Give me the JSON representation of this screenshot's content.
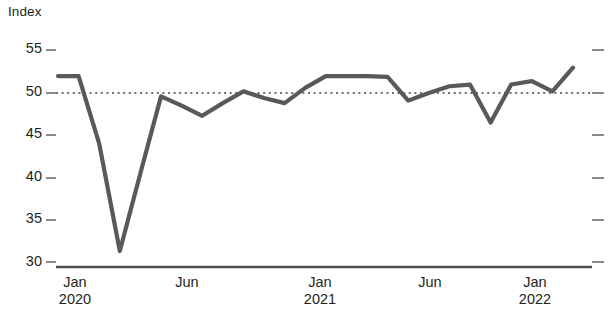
{
  "chart_data": {
    "type": "line",
    "title": "",
    "subtitle": "",
    "ylabel": "Index",
    "xlabel": "",
    "ylim": [
      29.2,
      56.5
    ],
    "yticks": [
      30,
      35,
      40,
      45,
      50,
      55
    ],
    "ytick_labels": [
      "30",
      "35",
      "40",
      "45",
      "50",
      "55"
    ],
    "grid": false,
    "legend": null,
    "reference_line": {
      "name": "no-change-level",
      "value": 50,
      "style": "dotted",
      "color": "#58595b"
    },
    "series": [
      {
        "name": "Index",
        "color": "#58595b",
        "x": [
          "Jan 2020",
          "Feb 2020",
          "Mar 2020",
          "Apr 2020",
          "May 2020",
          "Jun 2020",
          "Jul 2020",
          "Aug 2020",
          "Sep 2020",
          "Oct 2020",
          "Nov 2020",
          "Dec 2020",
          "Jan 2021",
          "Feb 2021",
          "Mar 2021",
          "Apr 2021",
          "May 2021",
          "Jun 2021",
          "Jul 2021",
          "Aug 2021",
          "Sep 2021",
          "Oct 2021",
          "Nov 2021",
          "Dec 2021",
          "Jan 2022",
          "Feb 2022"
        ],
        "values": [
          52.0,
          52.0,
          44.0,
          31.3,
          40.5,
          49.6,
          48.5,
          47.3,
          48.8,
          50.2,
          49.4,
          48.8,
          50.6,
          52.0,
          52.0,
          52.0,
          51.9,
          49.1,
          50.0,
          50.8,
          51.0,
          46.5,
          51.0,
          51.4,
          50.2,
          53.0
        ]
      }
    ],
    "xtick_positions": [
      "Jan 2020",
      "Jun 2020",
      "Jan 2021",
      "Jun 2021",
      "Jan 2022"
    ],
    "xticks": [
      {
        "month": "Jan",
        "year": "2020"
      },
      {
        "month": "Jun",
        "year": ""
      },
      {
        "month": "Jan",
        "year": "2021"
      },
      {
        "month": "Jun",
        "year": ""
      },
      {
        "month": "Jan",
        "year": "2022"
      }
    ]
  },
  "axis": {
    "y_title": "Index",
    "y_tick_0": "30",
    "y_tick_1": "35",
    "y_tick_2": "40",
    "y_tick_3": "45",
    "y_tick_4": "50",
    "y_tick_5": "55",
    "x_tick_0_month": "Jan",
    "x_tick_0_year": "2020",
    "x_tick_1_month": "Jun",
    "x_tick_1_year": "",
    "x_tick_2_month": "Jan",
    "x_tick_2_year": "2021",
    "x_tick_3_month": "Jun",
    "x_tick_3_year": "",
    "x_tick_4_month": "Jan",
    "x_tick_4_year": "2022"
  },
  "colors": {
    "series_line": "#58595b",
    "axis_line": "#4d4d4f",
    "tick_mark": "#6d6e71",
    "text": "#231f20",
    "reference_line": "#6d6e71",
    "background": "#ffffff"
  }
}
